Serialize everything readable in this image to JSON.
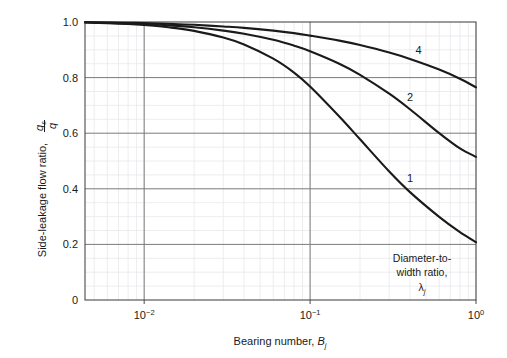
{
  "chart_data": {
    "type": "line",
    "title": "",
    "xlabel": "Bearing number, B_j",
    "ylabel": "Side-leakage flow ratio, q_s/q",
    "xscale": "log",
    "xlim": [
      0.0044,
      1.0
    ],
    "ylim": [
      0,
      1.0
    ],
    "grid": true,
    "minor_grid": true,
    "legend": "curve-end-labels",
    "annotation": "Diameter-to-width ratio, lambda_j",
    "xticks": [
      {
        "value": 0.01,
        "label": "10-2",
        "mantissa": "10",
        "exponent": "−2"
      },
      {
        "value": 0.1,
        "label": "10-1",
        "mantissa": "10",
        "exponent": "−1"
      },
      {
        "value": 1.0,
        "label": "100",
        "mantissa": "10",
        "exponent": "0"
      }
    ],
    "yticks": [
      {
        "value": 0,
        "label": "0"
      },
      {
        "value": 0.2,
        "label": "0.2"
      },
      {
        "value": 0.4,
        "label": "0.4"
      },
      {
        "value": 0.6,
        "label": "0.6"
      },
      {
        "value": 0.8,
        "label": "0.8"
      },
      {
        "value": 1.0,
        "label": "1.0"
      }
    ],
    "series": [
      {
        "name": "4",
        "label": "4",
        "x": [
          0.0044,
          0.006,
          0.008,
          0.01,
          0.015,
          0.02,
          0.03,
          0.04,
          0.06,
          0.08,
          0.1,
          0.15,
          0.2,
          0.3,
          0.4,
          0.6,
          0.8,
          1.0
        ],
        "y": [
          0.999,
          0.998,
          0.997,
          0.996,
          0.993,
          0.99,
          0.984,
          0.979,
          0.969,
          0.96,
          0.951,
          0.933,
          0.917,
          0.89,
          0.867,
          0.829,
          0.796,
          0.765
        ]
      },
      {
        "name": "2",
        "label": "2",
        "x": [
          0.0044,
          0.006,
          0.008,
          0.01,
          0.015,
          0.02,
          0.03,
          0.04,
          0.06,
          0.08,
          0.1,
          0.15,
          0.2,
          0.3,
          0.4,
          0.6,
          0.8,
          1.0
        ],
        "y": [
          0.999,
          0.997,
          0.995,
          0.993,
          0.987,
          0.981,
          0.969,
          0.958,
          0.936,
          0.915,
          0.895,
          0.85,
          0.81,
          0.742,
          0.686,
          0.6,
          0.545,
          0.515
        ]
      },
      {
        "name": "1",
        "label": "1",
        "x": [
          0.0044,
          0.006,
          0.008,
          0.01,
          0.015,
          0.02,
          0.03,
          0.04,
          0.06,
          0.08,
          0.1,
          0.15,
          0.2,
          0.3,
          0.4,
          0.6,
          0.8,
          1.0
        ],
        "y": [
          0.998,
          0.996,
          0.993,
          0.989,
          0.979,
          0.968,
          0.944,
          0.919,
          0.868,
          0.818,
          0.768,
          0.66,
          0.578,
          0.462,
          0.388,
          0.299,
          0.244,
          0.208
        ]
      }
    ]
  },
  "axes": {
    "y_label_text": "Side-leakage flow ratio,",
    "y_frac_num": "q",
    "y_frac_num_sub": "s",
    "y_frac_den": "q",
    "x_label_text": "Bearing number,",
    "x_label_sym": "B",
    "x_label_sub": "j"
  },
  "annotation": {
    "line1": "Diameter-to-",
    "line2": "width ratio,",
    "line3_sym": "λ",
    "line3_sub": "j"
  },
  "colors": {
    "curve": "#1a1a1a",
    "major_grid": "#7a7a7a",
    "minor_grid": "#e9e9ec",
    "axis": "#4a4a4a",
    "background": "#ffffff",
    "text": "#1a1a1a"
  }
}
